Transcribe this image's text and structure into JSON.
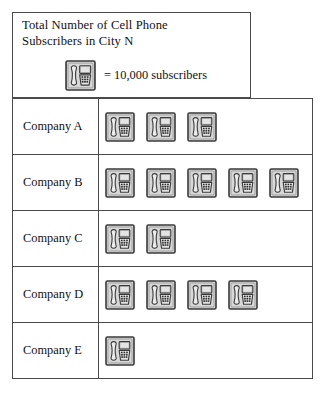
{
  "figure": {
    "type": "pictograph",
    "title_box": {
      "title": "Total Number of Cell Phone\nSubscribers in City N",
      "legend": {
        "icon": "phone-icon",
        "text": "= 10,000 subscribers",
        "unit_value": 10000
      }
    }
  },
  "chart_data": {
    "type": "bar",
    "title": "Total Number of Cell Phone Subscribers in City N",
    "xlabel": "",
    "ylabel": "",
    "unit_label": "= 10,000 subscribers",
    "unit_value": 10000,
    "icon": "phone-icon",
    "categories": [
      "Company A",
      "Company B",
      "Company C",
      "Company D",
      "Company E"
    ],
    "icon_counts": [
      3,
      5,
      2,
      4,
      1
    ],
    "values": [
      30000,
      50000,
      20000,
      40000,
      10000
    ],
    "xlim": [
      0,
      5
    ],
    "grid": false,
    "legend_position": "top"
  },
  "rows": [
    {
      "label": "Company A",
      "icons": 3,
      "value": 30000
    },
    {
      "label": "Company B",
      "icons": 5,
      "value": 50000
    },
    {
      "label": "Company C",
      "icons": 2,
      "value": 20000
    },
    {
      "label": "Company D",
      "icons": 4,
      "value": 40000
    },
    {
      "label": "Company E",
      "icons": 1,
      "value": 10000
    }
  ],
  "colors": {
    "border": "#4a4a4a",
    "icon_fill": "#d8d8d8",
    "icon_stroke": "#3a3a3a",
    "icon_screen": "#c9c9c9",
    "text": "#111111",
    "background": "#ffffff"
  }
}
